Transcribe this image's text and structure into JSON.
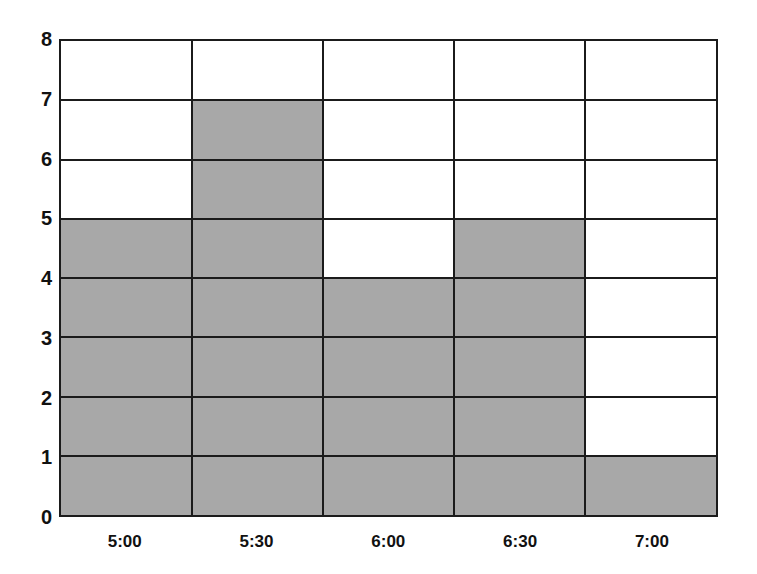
{
  "chart_data": {
    "type": "bar",
    "title": "",
    "subtitle": "",
    "xlabel": "",
    "ylabel": "",
    "categories": [
      "5:00",
      "5:30",
      "6:00",
      "6:30",
      "7:00"
    ],
    "values": [
      5,
      7,
      4,
      5,
      1
    ],
    "series": [
      {
        "name": "",
        "values": [
          5,
          7,
          4,
          5,
          1
        ]
      }
    ],
    "ylim": [
      0,
      8
    ],
    "ytick_labels": [
      "0",
      "1",
      "2",
      "3",
      "4",
      "5",
      "6",
      "7",
      "8"
    ],
    "ytick_values": [
      0,
      1,
      2,
      3,
      4,
      5,
      6,
      7,
      8
    ],
    "xtick_labels": [
      "5:00",
      "5:30",
      "6:00",
      "6:30",
      "7:00"
    ],
    "grid": true,
    "legend": false,
    "legend_position": "none",
    "annotations": [],
    "bar_fill_color": "#a8a8a8",
    "grid_color": "#1b1b1b",
    "plot_background": "#ffffff",
    "page_background": "#ffffff"
  }
}
